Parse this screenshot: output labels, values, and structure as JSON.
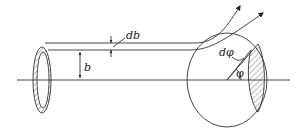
{
  "figure": {
    "type": "scattering-cross-section-diagram",
    "labels": {
      "db": "db",
      "b": "b",
      "dphi": "dφ",
      "phi": "φ"
    },
    "elements": [
      "incident annulus (hatched ring) of radius b and width db",
      "beam axis",
      "two incident trajectories",
      "scattering sphere",
      "scattered trajectories with arrows",
      "hatched annular strip on sphere subtending dφ at angle φ"
    ],
    "colors": {
      "stroke": "#333333",
      "background": "#ffffff"
    }
  }
}
